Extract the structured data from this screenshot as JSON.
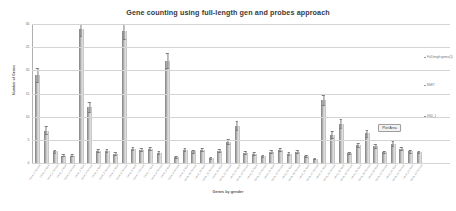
{
  "chart_data": {
    "type": "bar",
    "title": "Gene counting using full-length gen and probes approach",
    "xlabel": "Genes by gender",
    "ylabel": "Number of Genes",
    "ylim": [
      0,
      30
    ],
    "yticks": [
      0,
      5,
      10,
      15,
      20,
      25,
      30
    ],
    "ytick_labels": [
      "0",
      "5",
      "10",
      "15",
      "20",
      "25",
      "30"
    ],
    "grid": true,
    "legend_position": "right",
    "legend": [
      "Full-length genes(1)",
      "NSET",
      "SSU_1"
    ],
    "categories": [
      "Gene_1 Female",
      "Gene_1 Male",
      "Gene_2 Female",
      "Gene_2 Male",
      "Gene_3 Female",
      "Gene_3 Male",
      "Gene_4 Female",
      "Gene_4 Male",
      "Gene_5 Female",
      "Gene_5 Male",
      "Gene_6 Female",
      "Gene_6 Male",
      "Gene_7 Female",
      "Gene_7 Male",
      "Gene_8 Female",
      "Gene_8 Male",
      "Gene_9 Female",
      "Gene_9 Male",
      "Gene_10 Female",
      "Gene_10 Male",
      "Gene_11 Female",
      "Gene_11 Male",
      "Gene_12 Female",
      "Gene_12 Male",
      "Gene_13 Female",
      "Gene_13 Male",
      "Gene_14 Female",
      "Gene_14 Male",
      "Gene_15 Female",
      "Gene_15 Male",
      "Gene_16 Female",
      "Gene_16 Male",
      "Gene_17 Female",
      "Gene_17 Male",
      "Gene_18 Female",
      "Gene_18 Male",
      "Gene_19 Female",
      "Gene_19 Male",
      "Gene_20 Female",
      "Gene_20 Male",
      "Gene_21 Female",
      "Gene_21 Male",
      "Gene_22 Female",
      "Gene_22 Male",
      "Gene_23 Female"
    ],
    "values": [
      19.0,
      7.0,
      2.5,
      1.6,
      1.6,
      29.0,
      12.0,
      2.6,
      2.6,
      2.0,
      28.5,
      3.0,
      2.8,
      3.0,
      2.2,
      22.0,
      1.2,
      2.8,
      2.5,
      2.8,
      1.0,
      2.6,
      4.5,
      8.0,
      2.2,
      2.0,
      1.5,
      2.4,
      2.8,
      2.0,
      2.4,
      1.5,
      0.9,
      13.5,
      6.0,
      8.5,
      2.1,
      3.9,
      6.4,
      3.6,
      2.3,
      4.2,
      3.1,
      2.5,
      2.3
    ],
    "errors": [
      1.6,
      0.9,
      0.35,
      0.3,
      0.3,
      1.7,
      1.1,
      0.35,
      0.35,
      0.3,
      1.8,
      0.4,
      0.35,
      0.4,
      0.3,
      1.7,
      0.25,
      0.35,
      0.35,
      0.35,
      0.2,
      0.35,
      0.6,
      1.0,
      0.3,
      0.3,
      0.3,
      0.35,
      0.35,
      0.3,
      0.35,
      0.3,
      0.2,
      1.2,
      0.8,
      1.0,
      0.3,
      0.5,
      0.8,
      0.5,
      0.35,
      0.55,
      0.45,
      0.35,
      0.35
    ]
  },
  "tooltip": {
    "label": "Plot Area"
  },
  "colors": {
    "bar_light": "#e2e2e2",
    "bar_dark": "#9a9a9a",
    "gridline": "#d4d4d4",
    "text": "#6a6a6a",
    "title": "#3a3a3a"
  }
}
